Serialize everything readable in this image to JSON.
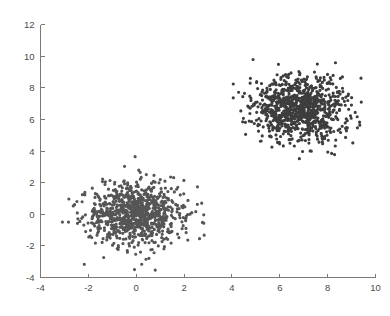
{
  "chart_data": {
    "type": "scatter",
    "title": "",
    "xlabel": "",
    "ylabel": "",
    "xlim": [
      -4,
      10
    ],
    "ylim": [
      -4,
      12
    ],
    "xticks": [
      -4,
      -2,
      0,
      2,
      4,
      6,
      8,
      10
    ],
    "yticks": [
      -4,
      -2,
      0,
      2,
      4,
      6,
      8,
      10,
      12
    ],
    "xticklabels": [
      "-4",
      "-2",
      "0",
      "2",
      "4",
      "6",
      "8",
      "10"
    ],
    "yticklabels": [
      "-4",
      "-2",
      "0",
      "2",
      "4",
      "6",
      "8",
      "10",
      "12"
    ],
    "grid": false,
    "legend": null,
    "marker": "dot",
    "marker_size": 1.6,
    "point_color": "#4d4d4d",
    "axis_color": "#7a7a7a",
    "background_color": "#ffffff",
    "series": [
      {
        "name": "cluster-1",
        "center": [
          0.0,
          0.0
        ],
        "std": [
          1.0,
          1.0
        ],
        "n_points": 900,
        "color": "#555555",
        "seed": 20219
      },
      {
        "name": "cluster-2",
        "center": [
          6.8,
          6.7
        ],
        "std": [
          1.0,
          1.0
        ],
        "n_points": 950,
        "color": "#3d3d3d",
        "seed": 77431
      }
    ]
  },
  "axes": {
    "spines": [
      "left",
      "bottom"
    ],
    "tick_direction": "in",
    "tick_length": 4
  }
}
